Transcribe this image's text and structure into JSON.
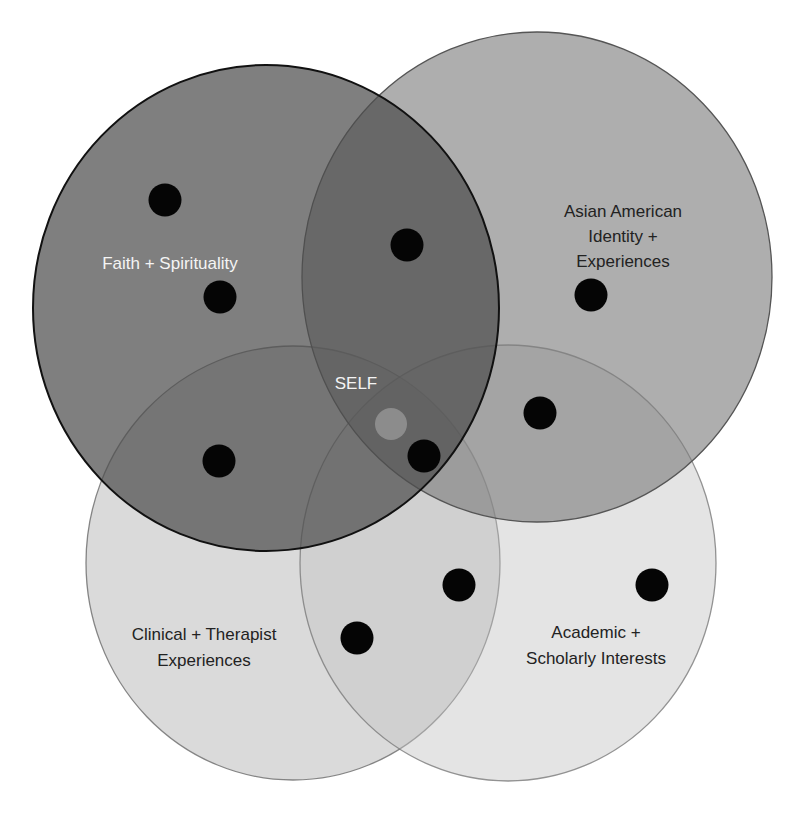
{
  "diagram": {
    "type": "four-set venn diagram",
    "colors": {
      "background": "#ffffff",
      "faith_fill": "#5a5a5a",
      "asian_fill": "#8a8a8a",
      "clinical_fill": "#c9c9c9",
      "academic_fill": "#d4d4d4",
      "dot": "#050505",
      "self_marker": "#8c8c8c",
      "outline": "#1a1a1a"
    },
    "sets": [
      {
        "id": "faith",
        "label_lines": [
          "Faith + Spirituality"
        ],
        "label_color": "#f4f4f4"
      },
      {
        "id": "asian",
        "label_lines": [
          "Asian American",
          "Identity +",
          "Experiences"
        ],
        "label_color": "#222222"
      },
      {
        "id": "clinical",
        "label_lines": [
          "Clinical + Therapist",
          "Experiences"
        ],
        "label_color": "#222222"
      },
      {
        "id": "academic",
        "label_lines": [
          "Academic +",
          "Scholarly Interests"
        ],
        "label_color": "#222222"
      }
    ],
    "center": {
      "label": "SELF",
      "label_color": "#f4f4f4"
    },
    "dots": [
      {
        "region": "faith",
        "x": 165,
        "y": 200
      },
      {
        "region": "faith",
        "x": 220,
        "y": 297
      },
      {
        "region": "faith+asian",
        "x": 407,
        "y": 245
      },
      {
        "region": "asian",
        "x": 591,
        "y": 295
      },
      {
        "region": "faith+clinical",
        "x": 219,
        "y": 461
      },
      {
        "region": "asian+academic",
        "x": 540,
        "y": 413
      },
      {
        "region": "faith+asian+academic",
        "x": 424,
        "y": 456
      },
      {
        "region": "clinical+academic",
        "x": 459,
        "y": 585
      },
      {
        "region": "academic",
        "x": 652,
        "y": 585
      },
      {
        "region": "clinical+academic",
        "x": 357,
        "y": 638
      }
    ]
  }
}
